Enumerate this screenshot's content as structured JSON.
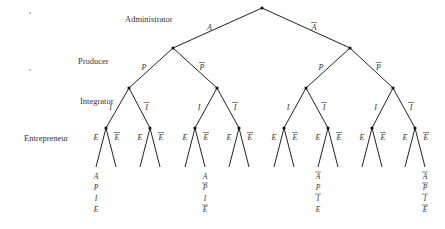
{
  "levels": {
    "administrator": "Administrator",
    "producer": "Producer",
    "integrator": "Integrator",
    "entrepreneur": "Entrepreneur"
  },
  "branches": {
    "A": {
      "symbol": "A",
      "negated": false
    },
    "notA": {
      "symbol": "A",
      "negated": true
    },
    "P": {
      "symbol": "P",
      "negated": false
    },
    "notP": {
      "symbol": "P",
      "negated": true
    },
    "I": {
      "symbol": "I",
      "negated": false
    },
    "notI": {
      "symbol": "I",
      "negated": true
    },
    "E": {
      "symbol": "E",
      "negated": false
    },
    "notE": {
      "symbol": "E",
      "negated": true
    }
  },
  "leaf_annotations": [
    {
      "leaf_index": 0,
      "items": [
        {
          "s": "A",
          "neg": false
        },
        {
          "s": "P",
          "neg": false
        },
        {
          "s": "I",
          "neg": false
        },
        {
          "s": "E",
          "neg": false
        }
      ]
    },
    {
      "leaf_index": 5,
      "items": [
        {
          "s": "A",
          "neg": false
        },
        {
          "s": "P",
          "neg": true
        },
        {
          "s": "I",
          "neg": false
        },
        {
          "s": "E",
          "neg": true
        }
      ]
    },
    {
      "leaf_index": 10,
      "items": [
        {
          "s": "A",
          "neg": true
        },
        {
          "s": "P",
          "neg": false
        },
        {
          "s": "I",
          "neg": true
        },
        {
          "s": "E",
          "neg": false
        }
      ]
    },
    {
      "leaf_index": 15,
      "items": [
        {
          "s": "A",
          "neg": true
        },
        {
          "s": "P",
          "neg": true
        },
        {
          "s": "I",
          "neg": true
        },
        {
          "s": "E",
          "neg": true
        }
      ]
    }
  ]
}
